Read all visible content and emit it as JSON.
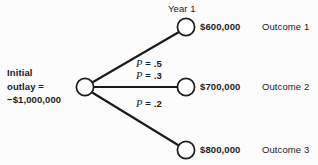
{
  "diagram": {
    "type": "decision-tree",
    "title_header": "Year 1",
    "root": {
      "label_line_1": "Initial",
      "label_line_2": "outlay =",
      "label_line_3": "−$1,000,000",
      "value": "-1000000"
    },
    "branches": [
      {
        "probability_label": "= .5",
        "probability_symbol": "P",
        "probability_value": 0.5,
        "amount": "$600,000",
        "amount_value": 600000,
        "outcome": "Outcome 1"
      },
      {
        "probability_label": "= .3",
        "probability_symbol": "P",
        "probability_value": 0.3,
        "amount": "$700,000",
        "amount_value": 700000,
        "outcome": "Outcome 2"
      },
      {
        "probability_label": "= .2",
        "probability_symbol": "P",
        "probability_value": 0.2,
        "amount": "$800,000",
        "amount_value": 800000,
        "outcome": "Outcome 3"
      }
    ],
    "colors": {
      "background": "#fcfcfc",
      "line": "#1a1a1a",
      "text": "#1a1a1a",
      "node_fill": "#ffffff"
    }
  }
}
